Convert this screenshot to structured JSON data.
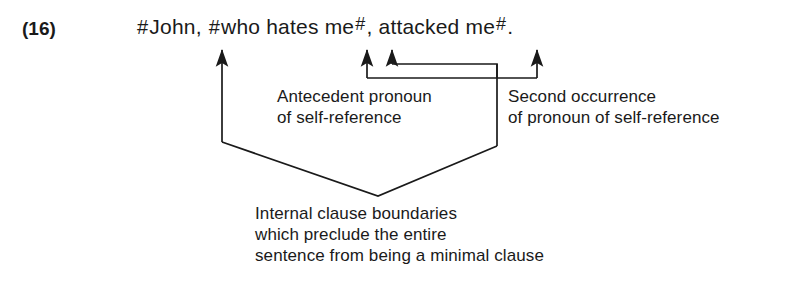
{
  "figure": {
    "example_number": "(16)",
    "boundary_marker": "#"
  },
  "sentence": {
    "full_text": "#John, #who hates me#, attacked me#.",
    "segments": [
      {
        "kind": "hash",
        "text": "#"
      },
      {
        "kind": "word",
        "text": "John, "
      },
      {
        "kind": "hash",
        "text": "#"
      },
      {
        "kind": "word",
        "text": "who hates me"
      },
      {
        "kind": "hash-sup",
        "text": "#"
      },
      {
        "kind": "word",
        "text": ", attacked me"
      },
      {
        "kind": "hash-sup",
        "text": "#"
      },
      {
        "kind": "word",
        "text": "."
      }
    ]
  },
  "annotations": [
    {
      "id": "antecedent",
      "line1": "Antecedent pronoun",
      "line2": "of self-reference"
    },
    {
      "id": "second-occurrence",
      "line1": "Second occurrence",
      "line2": "of pronoun of self-reference"
    },
    {
      "id": "internal-clause-boundaries",
      "line1": "Internal clause boundaries",
      "line2": "which preclude the entire",
      "line3": "sentence from being a minimal clause"
    }
  ],
  "colors": {
    "ink": "#1a1a1a",
    "background": "#ffffff"
  }
}
